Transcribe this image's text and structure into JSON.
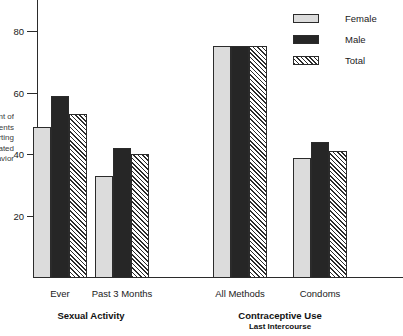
{
  "chart_data": {
    "type": "bar",
    "title": "",
    "xlabel": "",
    "ylabel": "Percent of\nAdolescents\nReporting\nIndicated\nBehavior",
    "ylim": [
      0,
      90
    ],
    "yticks": [
      20,
      40,
      60,
      80
    ],
    "ytick_labels": [
      "20",
      "40",
      "60",
      "80"
    ],
    "grid": false,
    "legend_position": "top-right",
    "categories": [
      "Ever",
      "Past 3 Months",
      "All Methods",
      "Condoms"
    ],
    "group_labels": [
      {
        "label": "Sexual Activity",
        "sublabel": "",
        "categories": [
          "Ever",
          "Past 3 Months"
        ]
      },
      {
        "label": "Contraceptive Use",
        "sublabel": "Last Intercourse",
        "categories": [
          "All Methods",
          "Condoms"
        ]
      }
    ],
    "series": [
      {
        "name": "Female",
        "color": "#dcdcdc",
        "pattern": "solid-light",
        "values": [
          49,
          33,
          75,
          39
        ]
      },
      {
        "name": "Male",
        "color": "#262626",
        "pattern": "solid-dark",
        "values": [
          59,
          42,
          75,
          44
        ]
      },
      {
        "name": "Total",
        "color": "#ffffff",
        "pattern": "diagonal-hatch",
        "values": [
          53,
          40,
          75,
          41
        ]
      }
    ]
  },
  "legend": {
    "items": [
      {
        "label": "Female",
        "swatch": "swatch-female"
      },
      {
        "label": "Male",
        "swatch": "swatch-male"
      },
      {
        "label": "Total",
        "swatch": "swatch-total"
      }
    ]
  }
}
